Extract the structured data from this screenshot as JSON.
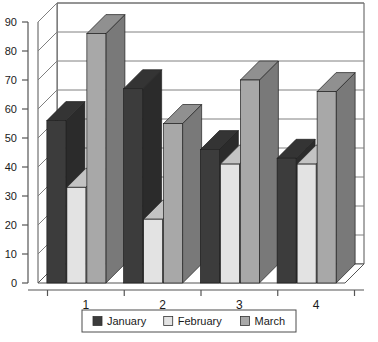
{
  "chart_data": {
    "type": "bar",
    "title": "",
    "subtitle": "",
    "xlabel": "",
    "ylabel": "",
    "categories": [
      "1",
      "2",
      "3",
      "4"
    ],
    "series": [
      {
        "name": "January",
        "color": "#3c3c3c",
        "values": [
          56,
          67,
          46,
          43
        ]
      },
      {
        "name": "February",
        "color": "#e3e3e3",
        "values": [
          33,
          22,
          41,
          41
        ]
      },
      {
        "name": "March",
        "color": "#a8a8a8",
        "values": [
          86,
          55,
          70,
          66
        ]
      }
    ],
    "ylim": [
      0,
      90
    ],
    "yticks": [
      0,
      10,
      20,
      30,
      40,
      50,
      60,
      70,
      80,
      90
    ],
    "ytick_labels": [
      "0",
      "10",
      "20",
      "30",
      "40",
      "50",
      "60",
      "70",
      "80",
      "90"
    ],
    "grid": true,
    "grid_axis": "y",
    "legend_position": "bottom",
    "style": "3d-clustered-column",
    "plot_background": "#ffffff",
    "axis_color": "#555555",
    "grid_color": "#808080",
    "legend_border_color": "#4d4d4d"
  },
  "legend": {
    "entries": [
      {
        "label": "January"
      },
      {
        "label": "February"
      },
      {
        "label": "March"
      }
    ]
  }
}
